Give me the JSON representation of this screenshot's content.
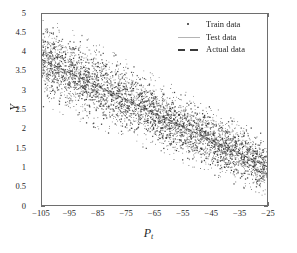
{
  "chart_data": {
    "type": "scatter",
    "title": "",
    "xlabel": "P_t",
    "xlabel_base": "P",
    "xlabel_sub": "t",
    "ylabel": "Y",
    "xlim": [
      -105,
      -25
    ],
    "ylim": [
      0,
      5
    ],
    "xticks": [
      -105,
      -95,
      -85,
      -75,
      -65,
      -55,
      -45,
      -35,
      -25
    ],
    "xticklabels": [
      "−105",
      "−95",
      "−85",
      "−75",
      "−65",
      "−55",
      "−45",
      "−35",
      "−25"
    ],
    "yticks": [
      0,
      0.5,
      1,
      1.5,
      2,
      2.5,
      3,
      3.5,
      4,
      4.5,
      5
    ],
    "yticklabels": [
      "0",
      "0.5",
      "1",
      "1.5",
      "2",
      "2.5",
      "3",
      "3.5",
      "4",
      "4.5",
      "5"
    ],
    "grid": false,
    "legend_position": "upper right",
    "n_points": 4200,
    "series": [
      {
        "name": "Train data",
        "style": "scatter",
        "marker": "dot",
        "color": "#2b2b2b",
        "description": "Dense cloud of training samples forming a downward sloping band",
        "trend_intercept_at_x_min": 3.82,
        "trend_intercept_at_x_max": 1.02,
        "spread_at_x_min": 0.46,
        "spread_at_x_max": 0.3,
        "x": [
          -105,
          -95,
          -85,
          -75,
          -65,
          -55,
          -45,
          -35,
          -25
        ],
        "y": [
          3.82,
          3.47,
          3.12,
          2.77,
          2.42,
          2.07,
          1.72,
          1.37,
          1.02
        ]
      },
      {
        "name": "Test data",
        "style": "line",
        "color": "#b4b4b4",
        "linestyle": "solid",
        "x": [
          -105,
          -95,
          -85,
          -75,
          -65,
          -55,
          -45,
          -35,
          -25
        ],
        "y": [
          3.8,
          3.46,
          3.11,
          2.76,
          2.41,
          2.06,
          1.71,
          1.37,
          1.03
        ]
      },
      {
        "name": "Actual data",
        "style": "line",
        "color": "#3a3a3a",
        "linestyle": "dashed",
        "x": [
          -105,
          -95,
          -85,
          -75,
          -65,
          -55,
          -45,
          -35,
          -25
        ],
        "y": [
          3.82,
          3.47,
          3.12,
          2.77,
          2.42,
          2.07,
          1.72,
          1.37,
          1.02
        ]
      }
    ],
    "legend": [
      "Train data",
      "Test data",
      "Actual data"
    ]
  },
  "figure": {
    "background": "#ffffff",
    "axis_color": "#6e6e6e",
    "text_color": "#1f1f1f"
  },
  "legend_keys": {
    "train": "dot-marker-icon",
    "test": "solid-line-icon",
    "actual": "dashed-line-icon"
  }
}
